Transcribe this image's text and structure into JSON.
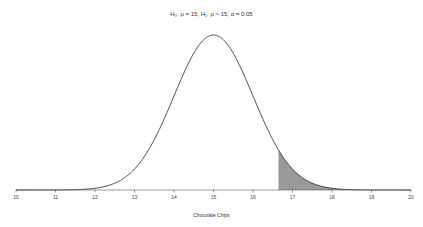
{
  "chart_data": {
    "type": "area",
    "title": "H₀: μ = 15, H₁: μ > 15, α = 0.05",
    "xlabel": "Chocolate Chips",
    "ylabel": "",
    "xlim": [
      10,
      20
    ],
    "x_ticks": [
      10,
      11,
      12,
      13,
      14,
      15,
      16,
      17,
      18,
      19,
      20
    ],
    "distribution": {
      "name": "normal",
      "mean": 15,
      "sd": 1
    },
    "shaded_region": {
      "from": 16.645,
      "to": 20,
      "tail": "upper",
      "area": 0.05,
      "color": "#999999"
    },
    "grid": false,
    "legend": null
  },
  "labels": {
    "title": "H₀: μ = 15, H₁: μ > 15, α = 0.05",
    "xlabel": "Chocolate Chips"
  }
}
